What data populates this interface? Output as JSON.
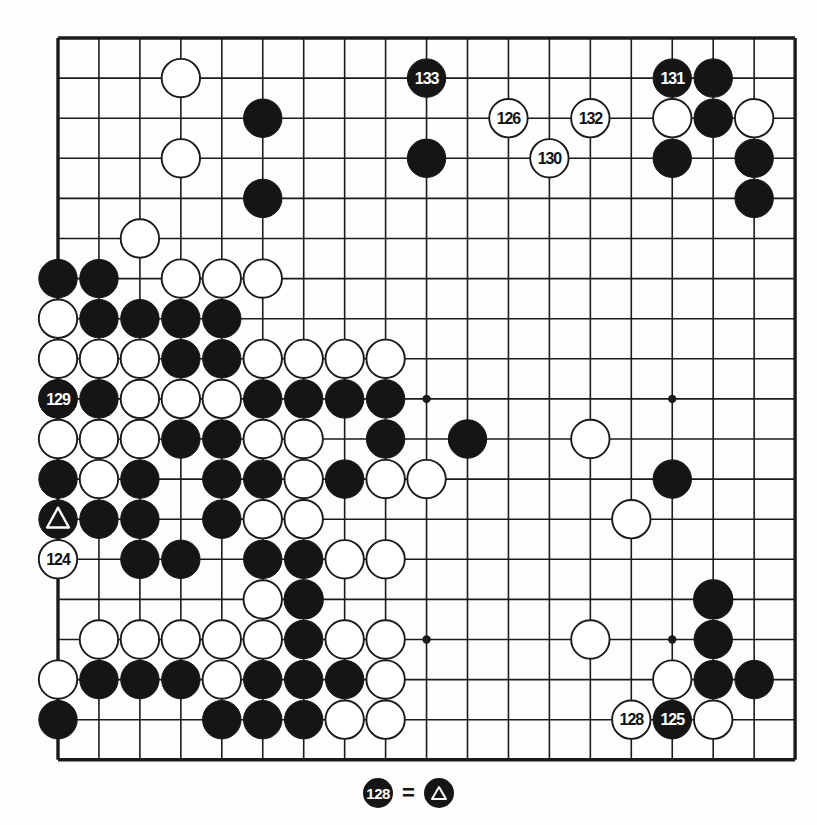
{
  "diagram": {
    "type": "go-board",
    "board_size": 19,
    "grid": {
      "origin_x": 58,
      "origin_y": 38,
      "spacing_x": 40.95,
      "spacing_y": 40.1
    },
    "colors": {
      "paper": "#fdfdfb",
      "line": "#1b1b1b",
      "black_stone": "#151515",
      "white_stone": "#ffffff",
      "white_stone_border": "#1b1b1b",
      "label_on_black": "#ffffff",
      "label_on_white": "#111111"
    },
    "star_points": [
      [
        3,
        3
      ],
      [
        9,
        3
      ],
      [
        15,
        3
      ],
      [
        3,
        9
      ],
      [
        9,
        9
      ],
      [
        15,
        9
      ],
      [
        3,
        15
      ],
      [
        9,
        15
      ],
      [
        15,
        15
      ]
    ],
    "black_stones": [
      [
        5,
        2
      ],
      [
        9,
        3
      ],
      [
        15,
        3
      ],
      [
        16,
        1
      ],
      [
        16,
        2
      ],
      [
        17,
        3
      ],
      [
        17,
        4
      ],
      [
        5,
        4
      ],
      [
        0,
        6
      ],
      [
        1,
        6
      ],
      [
        1,
        7
      ],
      [
        2,
        7
      ],
      [
        3,
        7
      ],
      [
        4,
        7
      ],
      [
        3,
        8
      ],
      [
        4,
        8
      ],
      [
        0,
        9
      ],
      [
        1,
        9
      ],
      [
        5,
        9
      ],
      [
        6,
        9
      ],
      [
        7,
        9
      ],
      [
        8,
        9
      ],
      [
        3,
        10
      ],
      [
        4,
        10
      ],
      [
        8,
        10
      ],
      [
        10,
        10
      ],
      [
        0,
        11
      ],
      [
        2,
        11
      ],
      [
        4,
        11
      ],
      [
        5,
        11
      ],
      [
        7,
        11
      ],
      [
        15,
        11
      ],
      [
        1,
        12
      ],
      [
        2,
        12
      ],
      [
        4,
        12
      ],
      [
        0,
        13
      ],
      [
        2,
        13
      ],
      [
        3,
        13
      ],
      [
        5,
        13
      ],
      [
        6,
        13
      ],
      [
        6,
        14
      ],
      [
        16,
        14
      ],
      [
        6,
        15
      ],
      [
        16,
        15
      ],
      [
        1,
        16
      ],
      [
        2,
        16
      ],
      [
        3,
        16
      ],
      [
        5,
        16
      ],
      [
        6,
        16
      ],
      [
        7,
        16
      ],
      [
        16,
        16
      ],
      [
        17,
        16
      ],
      [
        0,
        17
      ],
      [
        4,
        17
      ],
      [
        5,
        17
      ],
      [
        6,
        17
      ]
    ],
    "white_stones": [
      [
        3,
        1
      ],
      [
        3,
        3
      ],
      [
        17,
        2
      ],
      [
        15,
        2
      ],
      [
        2,
        5
      ],
      [
        3,
        6
      ],
      [
        4,
        6
      ],
      [
        5,
        6
      ],
      [
        0,
        7
      ],
      [
        0,
        8
      ],
      [
        1,
        8
      ],
      [
        2,
        8
      ],
      [
        5,
        8
      ],
      [
        6,
        8
      ],
      [
        7,
        8
      ],
      [
        8,
        8
      ],
      [
        2,
        9
      ],
      [
        3,
        9
      ],
      [
        4,
        9
      ],
      [
        0,
        10
      ],
      [
        1,
        10
      ],
      [
        2,
        10
      ],
      [
        5,
        10
      ],
      [
        6,
        10
      ],
      [
        13,
        10
      ],
      [
        1,
        11
      ],
      [
        6,
        11
      ],
      [
        8,
        11
      ],
      [
        9,
        11
      ],
      [
        5,
        12
      ],
      [
        6,
        12
      ],
      [
        14,
        12
      ],
      [
        7,
        13
      ],
      [
        8,
        13
      ],
      [
        5,
        14
      ],
      [
        6,
        14
      ],
      [
        16,
        14
      ],
      [
        1,
        15
      ],
      [
        2,
        15
      ],
      [
        3,
        15
      ],
      [
        4,
        15
      ],
      [
        5,
        15
      ],
      [
        7,
        15
      ],
      [
        8,
        15
      ],
      [
        13,
        15
      ],
      [
        0,
        16
      ],
      [
        4,
        16
      ],
      [
        8,
        16
      ],
      [
        15,
        16
      ],
      [
        7,
        17
      ],
      [
        8,
        17
      ],
      [
        16,
        17
      ]
    ],
    "marked_black_stone": {
      "col": 0,
      "row": 12,
      "mark": "triangle"
    },
    "numbered_moves": [
      {
        "number": "133",
        "col": 9,
        "row": 1,
        "color": "black"
      },
      {
        "number": "126",
        "col": 11,
        "row": 2,
        "color": "white"
      },
      {
        "number": "132",
        "col": 13,
        "row": 2,
        "color": "white"
      },
      {
        "number": "130",
        "col": 12,
        "row": 3,
        "color": "white"
      },
      {
        "number": "131",
        "col": 15,
        "row": 1,
        "color": "black"
      },
      {
        "number": "129",
        "col": 0,
        "row": 9,
        "color": "black"
      },
      {
        "number": "124",
        "col": 0,
        "row": 13,
        "color": "white"
      },
      {
        "number": "128",
        "col": 14,
        "row": 17,
        "color": "white"
      },
      {
        "number": "125",
        "col": 15,
        "row": 17,
        "color": "black"
      }
    ]
  },
  "caption": {
    "move_number": "128",
    "equals": "=",
    "mark_name": "triangle-marked-stone"
  }
}
